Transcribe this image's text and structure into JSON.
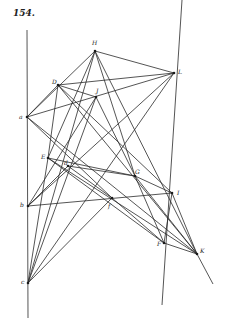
{
  "page": {
    "number": "154."
  },
  "diagram": {
    "points": {
      "H": {
        "label": "H",
        "x": 95,
        "y": 51,
        "lx": 92,
        "ly": 45
      },
      "L": {
        "label": "L",
        "x": 174,
        "y": 73,
        "lx": 178,
        "ly": 74
      },
      "D": {
        "label": "D",
        "x": 58,
        "y": 85,
        "lx": 52,
        "ly": 84
      },
      "J": {
        "label": "J",
        "x": 96,
        "y": 97,
        "lx": 96,
        "ly": 93
      },
      "a": {
        "label": "a",
        "x": 27,
        "y": 117,
        "lx": 19,
        "ly": 119
      },
      "E": {
        "label": "E",
        "x": 48,
        "y": 158,
        "lx": 41,
        "ly": 159
      },
      "d": {
        "label": "d",
        "x": 68,
        "y": 166,
        "lx": 64,
        "ly": 165
      },
      "G": {
        "label": "G",
        "x": 135,
        "y": 176,
        "lx": 135,
        "ly": 174
      },
      "I": {
        "label": "I",
        "x": 172,
        "y": 193,
        "lx": 177,
        "ly": 195
      },
      "b": {
        "label": "b",
        "x": 28,
        "y": 206,
        "lx": 20,
        "ly": 207
      },
      "f": {
        "label": "f",
        "x": 112,
        "y": 198,
        "lx": 108,
        "ly": 208
      },
      "F": {
        "label": "F",
        "x": 164,
        "y": 243,
        "lx": 157,
        "ly": 246
      },
      "K": {
        "label": "K",
        "x": 197,
        "y": 254,
        "lx": 200,
        "ly": 253
      },
      "c": {
        "label": "c",
        "x": 28,
        "y": 283,
        "lx": 21,
        "ly": 284
      }
    },
    "segments": [
      [
        "H",
        "L"
      ],
      [
        "H",
        "a"
      ],
      [
        "H",
        "E"
      ],
      [
        "H",
        "c"
      ],
      [
        "H",
        "G"
      ],
      [
        "H",
        "K"
      ],
      [
        "L",
        "a"
      ],
      [
        "L",
        "D"
      ],
      [
        "L",
        "b"
      ],
      [
        "L",
        "c"
      ],
      [
        "D",
        "a"
      ],
      [
        "D",
        "E"
      ],
      [
        "D",
        "J"
      ],
      [
        "D",
        "K"
      ],
      [
        "D",
        "I"
      ],
      [
        "J",
        "b"
      ],
      [
        "J",
        "c"
      ],
      [
        "J",
        "G"
      ],
      [
        "a",
        "f"
      ],
      [
        "a",
        "K"
      ],
      [
        "E",
        "G"
      ],
      [
        "E",
        "K"
      ],
      [
        "E",
        "F"
      ],
      [
        "E",
        "c"
      ],
      [
        "d",
        "G"
      ],
      [
        "d",
        "b"
      ],
      [
        "d",
        "f"
      ],
      [
        "G",
        "I"
      ],
      [
        "G",
        "F"
      ],
      [
        "G",
        "K"
      ],
      [
        "b",
        "I"
      ],
      [
        "f",
        "c"
      ],
      [
        "f",
        "F"
      ],
      [
        "I",
        "K"
      ],
      [
        "F",
        "K"
      ],
      [
        "I",
        "F"
      ]
    ],
    "verticals": [
      {
        "name": "left-line",
        "x1": 27,
        "y1": 30,
        "x2": 28,
        "y2": 318
      },
      {
        "name": "right-line",
        "x1": 182,
        "y1": 0,
        "x2": 162,
        "y2": 305
      }
    ],
    "extensions": [
      {
        "name": "K-extension",
        "x1": 197,
        "y1": 254,
        "x2": 213,
        "y2": 284
      }
    ]
  }
}
